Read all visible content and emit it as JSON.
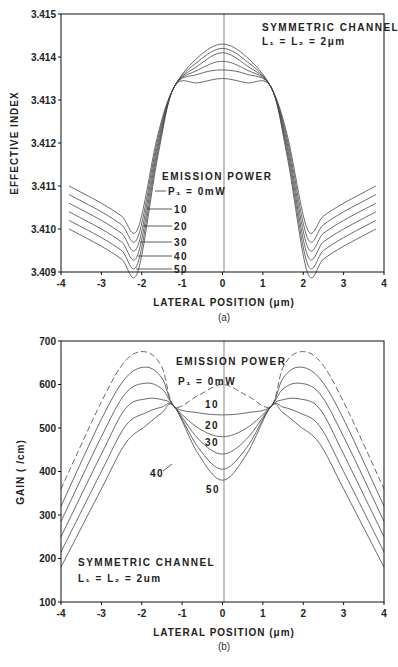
{
  "chart_data": [
    {
      "type": "line",
      "panel": "(a)",
      "title": "",
      "xlabel": "LATERAL POSITION (μm)",
      "ylabel": "EFFECTIVE INDEX",
      "xlim": [
        -4,
        4
      ],
      "ylim": [
        3.409,
        3.415
      ],
      "xticks": [
        "-4",
        "-3",
        "-2",
        "-1",
        "0",
        "1",
        "2",
        "3",
        "4"
      ],
      "yticks": [
        "3.409",
        "3.410",
        "3.411",
        "3.412",
        "3.413",
        "3.414",
        "3.415"
      ],
      "grid": false,
      "annotations": [
        "SYMMETRIC CHANNEL",
        "L1 = L2 = 2μm",
        "EMISSION POWER"
      ],
      "legend_title": "EMISSION POWER",
      "x": [
        -3.8,
        -3.0,
        -2.5,
        -2.1,
        -1.6,
        -1.2,
        -0.6,
        0,
        0.6,
        1.2,
        1.6,
        2.1,
        2.5,
        3.0,
        3.8
      ],
      "series": [
        {
          "name": "P1 = 0mW",
          "values": [
            3.411,
            3.4106,
            3.4103,
            3.41,
            3.4122,
            3.4133,
            3.414,
            3.4143,
            3.414,
            3.4133,
            3.4122,
            3.41,
            3.4103,
            3.4106,
            3.411
          ]
        },
        {
          "name": "10",
          "values": [
            3.4108,
            3.4104,
            3.4101,
            3.4098,
            3.4121,
            3.4133,
            3.4139,
            3.4142,
            3.4139,
            3.4133,
            3.4121,
            3.4098,
            3.4101,
            3.4104,
            3.4108
          ]
        },
        {
          "name": "20",
          "values": [
            3.4106,
            3.4102,
            3.4099,
            3.4096,
            3.412,
            3.4133,
            3.4138,
            3.4141,
            3.4138,
            3.4133,
            3.412,
            3.4096,
            3.4099,
            3.4102,
            3.4106
          ]
        },
        {
          "name": "30",
          "values": [
            3.4104,
            3.41,
            3.4097,
            3.4094,
            3.4119,
            3.4133,
            3.4137,
            3.4139,
            3.4137,
            3.4133,
            3.4119,
            3.4094,
            3.4097,
            3.41,
            3.4104
          ]
        },
        {
          "name": "40",
          "values": [
            3.4102,
            3.4098,
            3.4095,
            3.4092,
            3.4118,
            3.4133,
            3.4136,
            3.4137,
            3.4136,
            3.4133,
            3.4118,
            3.4092,
            3.4095,
            3.4098,
            3.4102
          ]
        },
        {
          "name": "50",
          "values": [
            3.41,
            3.4096,
            3.4093,
            3.409,
            3.4117,
            3.4133,
            3.4134,
            3.4135,
            3.4134,
            3.4133,
            3.4117,
            3.409,
            3.4093,
            3.4096,
            3.41
          ]
        }
      ]
    },
    {
      "type": "line",
      "panel": "(b)",
      "title": "",
      "xlabel": "LATERAL POSITION (μm)",
      "ylabel": "GAIN ( /cm)",
      "xlim": [
        -4,
        4
      ],
      "ylim": [
        100,
        700
      ],
      "xticks": [
        "-4",
        "-3",
        "-2",
        "-1",
        "0",
        "1",
        "2",
        "3",
        "4"
      ],
      "yticks": [
        "100",
        "200",
        "300",
        "400",
        "500",
        "600",
        "700"
      ],
      "grid": false,
      "annotations": [
        "EMISSION POWER",
        "SYMMETRIC CHANNEL",
        "L1 = L2 = 2um"
      ],
      "legend_title": "EMISSION POWER",
      "x": [
        -4,
        -3,
        -2.4,
        -1.9,
        -1.5,
        -1.2,
        -0.6,
        0,
        0.6,
        1.2,
        1.5,
        1.9,
        2.4,
        3,
        4
      ],
      "series": [
        {
          "name": "P1 = 0mW",
          "values": [
            360,
            560,
            655,
            675,
            640,
            550,
            575,
            600,
            575,
            550,
            640,
            675,
            655,
            560,
            360
          ]
        },
        {
          "name": "10",
          "values": [
            320,
            520,
            615,
            640,
            615,
            550,
            535,
            530,
            535,
            550,
            615,
            640,
            615,
            520,
            320
          ]
        },
        {
          "name": "20",
          "values": [
            285,
            480,
            580,
            603,
            590,
            550,
            500,
            480,
            500,
            550,
            590,
            603,
            580,
            480,
            285
          ]
        },
        {
          "name": "30",
          "values": [
            250,
            440,
            545,
            567,
            565,
            550,
            475,
            440,
            475,
            550,
            565,
            567,
            545,
            440,
            250
          ]
        },
        {
          "name": "40",
          "values": [
            215,
            400,
            505,
            535,
            548,
            550,
            455,
            405,
            455,
            550,
            548,
            535,
            505,
            400,
            215
          ]
        },
        {
          "name": "50",
          "values": [
            180,
            360,
            465,
            505,
            535,
            550,
            440,
            380,
            440,
            550,
            535,
            505,
            465,
            360,
            180
          ]
        }
      ]
    }
  ],
  "panel_a": {
    "ylabel": "EFFECTIVE INDEX",
    "xlabel": "LATERAL POSITION (μm)",
    "caption": "(a)",
    "channel_title": "SYMMETRIC CHANNEL",
    "channel_dims": "L₁ = L₂ = 2μm",
    "legend_title": "EMISSION POWER",
    "legend_labels": [
      "P₁ = 0mW",
      "10",
      "20",
      "30",
      "40",
      "50"
    ],
    "yticks": [
      "3.415",
      "3.414",
      "3.413",
      "3.412",
      "3.411",
      "3.410",
      "3.409"
    ],
    "xticks": [
      "-4",
      "-3",
      "-2",
      "-1",
      "0",
      "1",
      "2",
      "3",
      "4"
    ]
  },
  "panel_b": {
    "ylabel": "GAIN ( /cm)",
    "xlabel": "LATERAL POSITION (μm)",
    "caption": "(b)",
    "channel_title": "SYMMETRIC CHANNEL",
    "channel_dims": "L₁ = L₂ = 2um",
    "legend_title": "EMISSION POWER",
    "legend_labels": [
      "P₁ = 0mW",
      "10",
      "20",
      "30",
      "40",
      "50"
    ],
    "yticks": [
      "700",
      "600",
      "500",
      "400",
      "300",
      "200",
      "100"
    ],
    "xticks": [
      "-4",
      "-3",
      "-2",
      "-1",
      "0",
      "1",
      "2",
      "3",
      "4"
    ]
  },
  "colors": {
    "line": "#444444",
    "axis": "#111111",
    "text": "#222222"
  }
}
